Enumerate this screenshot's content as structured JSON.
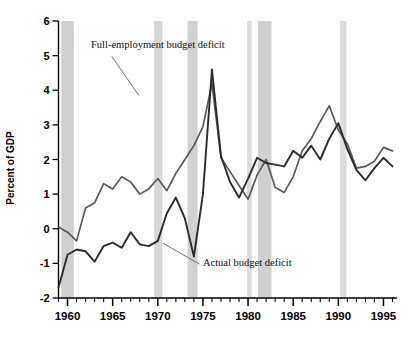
{
  "chart_data": {
    "type": "line",
    "title": "",
    "xlabel": "",
    "ylabel": "Percent of GDP",
    "xlim": [
      1959,
      1996.5
    ],
    "ylim": [
      -2,
      6
    ],
    "yticks": [
      -2,
      -1,
      0,
      1,
      2,
      3,
      4,
      5,
      6
    ],
    "ytick_labels": [
      "-2",
      "-1",
      "0",
      "1",
      "2",
      "3",
      "4",
      "5",
      "6"
    ],
    "xticks": [
      1960,
      1965,
      1970,
      1975,
      1980,
      1985,
      1990,
      1995
    ],
    "xtick_labels": [
      "1960",
      "1965",
      "1970",
      "1975",
      "1980",
      "1985",
      "1990",
      "1995"
    ],
    "minor_xtick_interval": 1,
    "grid": false,
    "legend_position": "inline-annotations",
    "series": [
      {
        "name": "Full-employment budget deficit",
        "color": "#595959",
        "x": [
          1959,
          1960,
          1961,
          1962,
          1963,
          1964,
          1965,
          1966,
          1967,
          1968,
          1969,
          1970,
          1971,
          1972,
          1973,
          1974,
          1975,
          1976,
          1977,
          1978,
          1979,
          1980,
          1981,
          1982,
          1983,
          1984,
          1985,
          1986,
          1987,
          1988,
          1989,
          1990,
          1991,
          1992,
          1993,
          1994,
          1995,
          1996
        ],
        "y": [
          0.05,
          -0.1,
          -0.35,
          0.6,
          0.75,
          1.3,
          1.15,
          1.5,
          1.35,
          1.0,
          1.15,
          1.45,
          1.1,
          1.6,
          2.0,
          2.4,
          2.95,
          4.2,
          2.05,
          1.65,
          1.25,
          0.85,
          1.55,
          2.0,
          1.2,
          1.05,
          1.5,
          2.25,
          2.6,
          3.1,
          3.55,
          2.85,
          2.45,
          1.75,
          1.8,
          1.95,
          2.35,
          2.25
        ],
        "annotation": "Full-employment budget deficit"
      },
      {
        "name": "Actual budget deficit",
        "color": "#2b2b2b",
        "x": [
          1959,
          1960,
          1961,
          1962,
          1963,
          1964,
          1965,
          1966,
          1967,
          1968,
          1969,
          1970,
          1971,
          1972,
          1973,
          1974,
          1975,
          1976,
          1977,
          1978,
          1979,
          1980,
          1981,
          1982,
          1983,
          1984,
          1985,
          1986,
          1987,
          1988,
          1989,
          1990,
          1991,
          1992,
          1993,
          1994,
          1995,
          1996
        ],
        "y": [
          -1.7,
          -0.75,
          -0.6,
          -0.65,
          -0.95,
          -0.5,
          -0.4,
          -0.55,
          -0.1,
          -0.45,
          -0.5,
          -0.35,
          0.45,
          0.9,
          0.3,
          -0.8,
          1.0,
          4.6,
          2.1,
          1.35,
          0.9,
          1.45,
          2.05,
          1.9,
          1.85,
          1.8,
          2.25,
          2.05,
          2.4,
          2.0,
          2.6,
          3.05,
          2.3,
          1.7,
          1.4,
          1.75,
          2.05,
          1.8
        ],
        "annotation": "Actual budget deficit"
      }
    ],
    "recession_bands": [
      {
        "start": 1959.3,
        "end": 1960.7,
        "color": "#cfcfcf"
      },
      {
        "start": 1969.6,
        "end": 1970.5,
        "color": "#d7d7d7"
      },
      {
        "start": 1973.3,
        "end": 1974.4,
        "color": "#d1d1d1"
      },
      {
        "start": 1979.9,
        "end": 1980.4,
        "color": "#dcdcdc"
      },
      {
        "start": 1981.1,
        "end": 1982.6,
        "color": "#d1d1d1"
      },
      {
        "start": 1990.2,
        "end": 1990.9,
        "color": "#dcdcdc"
      }
    ],
    "annotations": [
      {
        "text": "Full-employment budget deficit",
        "text_x": 1962.6,
        "text_y": 5.23,
        "leader_from_x": 1964.9,
        "leader_from_y": 4.98,
        "leader_to_x": 1967.9,
        "leader_to_y": 3.85
      },
      {
        "text": "Actual budget deficit",
        "text_x": 1975.0,
        "text_y": -1.08,
        "leader_from_x": 1974.6,
        "leader_from_y": -1.02,
        "leader_to_x": 1970.6,
        "leader_to_y": -0.42
      }
    ]
  },
  "axis_style": {
    "axis_color": "#000000",
    "axis_width": 1.4,
    "tick_length_major": 6,
    "tick_length_minor": 4
  }
}
